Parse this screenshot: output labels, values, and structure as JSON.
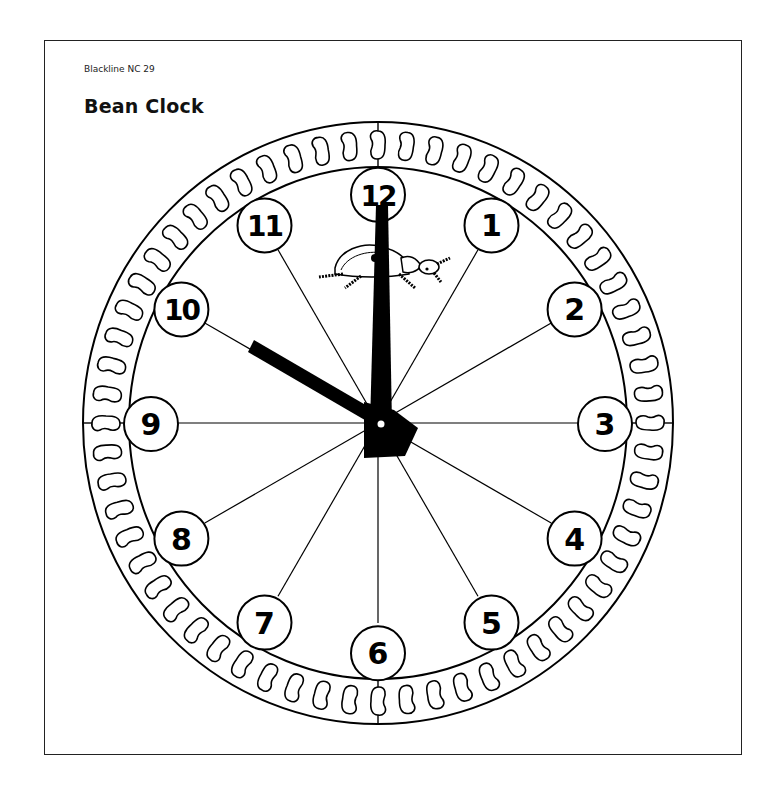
{
  "header": {
    "subtitle": "Blackline NC 29",
    "title": "Bean Clock"
  },
  "clock": {
    "numbers": [
      "12",
      "1",
      "2",
      "3",
      "4",
      "5",
      "6",
      "7",
      "8",
      "9",
      "10",
      "11"
    ],
    "bean_count": 60,
    "time_shown": "10:00",
    "hour_hand_points_to": "10",
    "minute_hand_points_to": "12",
    "decoration": "beetle-icon",
    "colors": {
      "ink": "#000000",
      "paper": "#ffffff"
    }
  }
}
